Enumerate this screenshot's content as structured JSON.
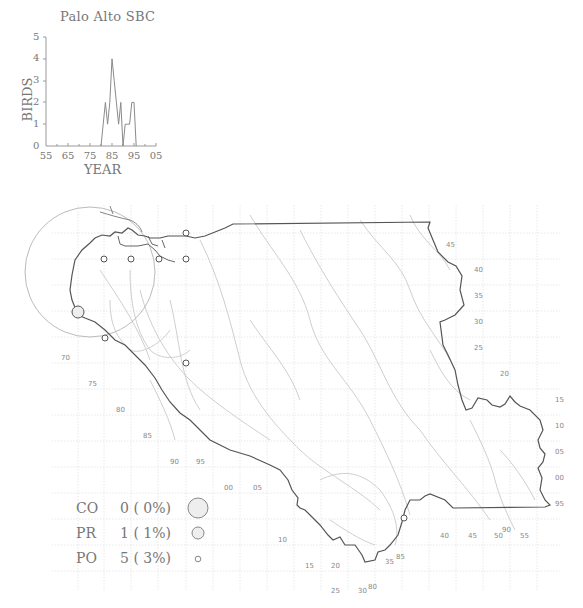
{
  "chart_data": {
    "type": "line",
    "title": "Palo Alto SBC",
    "xlabel": "YEAR",
    "ylabel": "BIRDS",
    "x_tick_labels": [
      "55",
      "65",
      "75",
      "85",
      "95",
      "05"
    ],
    "y_tick_labels": [
      "0",
      "1",
      "2",
      "3",
      "4",
      "5"
    ],
    "xlim": [
      1955,
      2005
    ],
    "ylim": [
      0,
      5
    ],
    "grid": false,
    "x": [
      1980,
      1981,
      1982,
      1983,
      1984,
      1985,
      1986,
      1987,
      1988,
      1989,
      1990,
      1991,
      1992,
      1993,
      1994,
      1995,
      1996
    ],
    "values": [
      0,
      1,
      2,
      1,
      2,
      4,
      3,
      2,
      1,
      2,
      0,
      1,
      1,
      1,
      2,
      2,
      0
    ]
  },
  "legend": {
    "items": [
      {
        "code": "CO",
        "count": "0",
        "percent": "( 0%)",
        "symbol": "large-circle"
      },
      {
        "code": "PR",
        "count": "1",
        "percent": "( 1%)",
        "symbol": "medium-circle"
      },
      {
        "code": "PO",
        "count": "5",
        "percent": "( 3%)",
        "symbol": "small-circle"
      }
    ]
  },
  "map": {
    "grid_labels_left": [
      "70",
      "75",
      "80",
      "85",
      "90",
      "95",
      "00",
      "05",
      "00",
      "05",
      "10",
      "15",
      "20",
      "25",
      "30"
    ],
    "grid_labels_right": [
      "45",
      "40",
      "35",
      "30",
      "25",
      "20",
      "15",
      "10",
      "05",
      "00",
      "95",
      "90",
      "85",
      "80",
      "35",
      "40",
      "45",
      "50",
      "55"
    ],
    "labels": [
      {
        "text": "45",
        "x": 446,
        "y": 241
      },
      {
        "text": "40",
        "x": 474,
        "y": 266
      },
      {
        "text": "35",
        "x": 474,
        "y": 292
      },
      {
        "text": "30",
        "x": 474,
        "y": 318
      },
      {
        "text": "25",
        "x": 474,
        "y": 344
      },
      {
        "text": "20",
        "x": 500,
        "y": 370
      },
      {
        "text": "15",
        "x": 555,
        "y": 396
      },
      {
        "text": "10",
        "x": 555,
        "y": 422
      },
      {
        "text": "05",
        "x": 555,
        "y": 448
      },
      {
        "text": "00",
        "x": 555,
        "y": 474
      },
      {
        "text": "95",
        "x": 555,
        "y": 500
      },
      {
        "text": "90",
        "x": 502,
        "y": 526
      },
      {
        "text": "55",
        "x": 520,
        "y": 532
      },
      {
        "text": "50",
        "x": 494,
        "y": 532
      },
      {
        "text": "45",
        "x": 468,
        "y": 532
      },
      {
        "text": "40",
        "x": 440,
        "y": 532
      },
      {
        "text": "85",
        "x": 396,
        "y": 553
      },
      {
        "text": "35",
        "x": 385,
        "y": 558
      },
      {
        "text": "80",
        "x": 368,
        "y": 583
      },
      {
        "text": "30",
        "x": 358,
        "y": 587
      },
      {
        "text": "25",
        "x": 331,
        "y": 587
      },
      {
        "text": "20",
        "x": 331,
        "y": 562
      },
      {
        "text": "15",
        "x": 305,
        "y": 562
      },
      {
        "text": "10",
        "x": 278,
        "y": 536
      },
      {
        "text": "05",
        "x": 253,
        "y": 484
      },
      {
        "text": "00",
        "x": 224,
        "y": 484
      },
      {
        "text": "95",
        "x": 196,
        "y": 458
      },
      {
        "text": "90",
        "x": 170,
        "y": 458
      },
      {
        "text": "85",
        "x": 143,
        "y": 432
      },
      {
        "text": "80",
        "x": 116,
        "y": 406
      },
      {
        "text": "75",
        "x": 88,
        "y": 380
      },
      {
        "text": "70",
        "x": 61,
        "y": 354
      }
    ],
    "sightings": [
      {
        "x": 186,
        "y": 233,
        "type": "PO"
      },
      {
        "x": 104,
        "y": 259,
        "type": "PO"
      },
      {
        "x": 131,
        "y": 259,
        "type": "PO"
      },
      {
        "x": 159,
        "y": 259,
        "type": "PO"
      },
      {
        "x": 186,
        "y": 259,
        "type": "PO"
      },
      {
        "x": 78,
        "y": 312,
        "type": "PR"
      },
      {
        "x": 105,
        "y": 338,
        "type": "PO"
      },
      {
        "x": 186,
        "y": 363,
        "type": "PO"
      },
      {
        "x": 404,
        "y": 518,
        "type": "PO"
      }
    ]
  }
}
